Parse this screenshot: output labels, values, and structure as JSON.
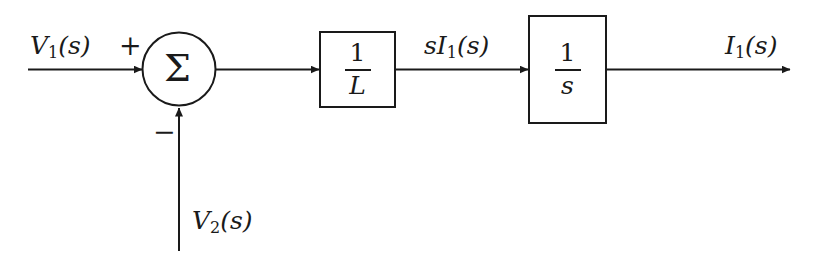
{
  "diagram": {
    "background_color": "#ffffff",
    "stroke_color": "#1a1a1a",
    "input_top": {
      "label": "V₁(s)",
      "label_base": "V",
      "label_sub": "1",
      "label_tail": "(s)",
      "sign": "+"
    },
    "input_bottom": {
      "label": "V₂(s)",
      "label_base": "V",
      "label_sub": "2",
      "label_tail": "(s)",
      "sign": "−"
    },
    "summing_junction": {
      "glyph": "Σ",
      "name": "summing-junction"
    },
    "blocks": [
      {
        "id": "gain-block",
        "numerator": "1",
        "denominator": "L",
        "expression": "1/L"
      },
      {
        "id": "integrator-block",
        "numerator": "1",
        "denominator": "s",
        "expression": "1/s"
      }
    ],
    "intermediate_signal": {
      "label": "sI₁(s)",
      "label_lead": "s",
      "label_base": "I",
      "label_sub": "1",
      "label_tail": "(s)"
    },
    "output_signal": {
      "label": "I₁(s)",
      "label_base": "I",
      "label_sub": "1",
      "label_tail": "(s)"
    }
  }
}
